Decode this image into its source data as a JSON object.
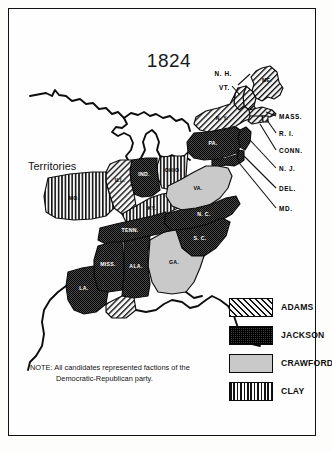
{
  "title": "1824",
  "territories_label": "Territories",
  "note": {
    "line1": "NOTE: All candidates represented factions of the",
    "line2": "Democratic-Republican party."
  },
  "legend": {
    "items": [
      {
        "label": "ADAMS",
        "pattern": "diagonal-hatch",
        "color": "#f2f2f2"
      },
      {
        "label": "JACKSON",
        "pattern": "dark-stipple",
        "color": "#2b2b2b"
      },
      {
        "label": "CRAWFORD",
        "pattern": "light-solid",
        "color": "#c9c9c9"
      },
      {
        "label": "CLAY",
        "pattern": "vertical-stripe",
        "color": "#ffffff"
      }
    ]
  },
  "map": {
    "states": [
      {
        "abbr": "ME",
        "label": "ME.",
        "candidate": "ADAMS"
      },
      {
        "abbr": "NH",
        "label": "N. H.",
        "candidate": "ADAMS"
      },
      {
        "abbr": "VT",
        "label": "VT.",
        "candidate": "ADAMS"
      },
      {
        "abbr": "NY",
        "label": "N. Y.",
        "candidate": "ADAMS"
      },
      {
        "abbr": "MASS",
        "label": "MASS.",
        "candidate": "ADAMS"
      },
      {
        "abbr": "RI",
        "label": "R. I.",
        "candidate": "ADAMS"
      },
      {
        "abbr": "CONN",
        "label": "CONN.",
        "candidate": "ADAMS"
      },
      {
        "abbr": "NJ",
        "label": "N. J.",
        "candidate": "JACKSON"
      },
      {
        "abbr": "DEL",
        "label": "DEL.",
        "candidate": "JACKSON"
      },
      {
        "abbr": "MD",
        "label": "MD.",
        "candidate": "JACKSON"
      },
      {
        "abbr": "PA",
        "label": "PA.",
        "candidate": "JACKSON"
      },
      {
        "abbr": "OHIO",
        "label": "OHIO",
        "candidate": "CLAY"
      },
      {
        "abbr": "IND",
        "label": "IND.",
        "candidate": "JACKSON"
      },
      {
        "abbr": "ILL",
        "label": "ILL.",
        "candidate": "ADAMS"
      },
      {
        "abbr": "MO",
        "label": "MO.",
        "candidate": "CLAY"
      },
      {
        "abbr": "KY",
        "label": "KY.",
        "candidate": "CLAY"
      },
      {
        "abbr": "VA",
        "label": "VA.",
        "candidate": "CRAWFORD"
      },
      {
        "abbr": "NC",
        "label": "N. C.",
        "candidate": "JACKSON"
      },
      {
        "abbr": "SC",
        "label": "S. C.",
        "candidate": "JACKSON"
      },
      {
        "abbr": "GA",
        "label": "GA.",
        "candidate": "CRAWFORD"
      },
      {
        "abbr": "TENN",
        "label": "TENN.",
        "candidate": "JACKSON"
      },
      {
        "abbr": "ALA",
        "label": "ALA.",
        "candidate": "JACKSON"
      },
      {
        "abbr": "MISS",
        "label": "MISS.",
        "candidate": "JACKSON"
      },
      {
        "abbr": "LA",
        "label": "LA.",
        "candidate": "JACKSON"
      }
    ],
    "leader_labels": [
      "N. H.",
      "VT.",
      "MASS.",
      "R. I.",
      "CONN.",
      "N. J.",
      "DEL.",
      "MD."
    ]
  }
}
